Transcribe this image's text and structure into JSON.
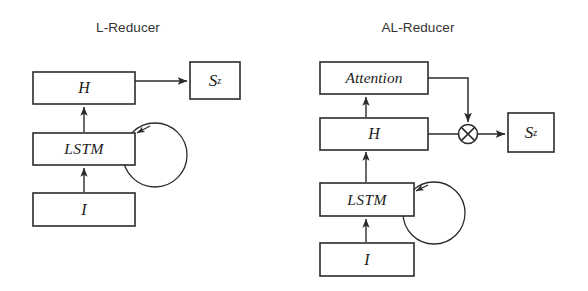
{
  "figure": {
    "background_color": "#ffffff",
    "stroke_color": "#2b2b2b",
    "title_color": "#333333"
  },
  "diagrams": [
    {
      "id": "l-reducer",
      "title": "L-Reducer",
      "nodes": [
        {
          "id": "h",
          "label": "H",
          "shape": "rect"
        },
        {
          "id": "lstm",
          "label": "LSTM",
          "shape": "rect"
        },
        {
          "id": "i",
          "label": "I",
          "shape": "rect"
        },
        {
          "id": "sz",
          "label": "S",
          "superscript": "z",
          "shape": "rect"
        }
      ],
      "edges": [
        {
          "from": "i",
          "to": "lstm",
          "kind": "arrow"
        },
        {
          "from": "lstm",
          "to": "h",
          "kind": "arrow"
        },
        {
          "from": "h",
          "to": "sz",
          "kind": "arrow"
        },
        {
          "from": "lstm",
          "to": "lstm",
          "kind": "self-loop"
        }
      ]
    },
    {
      "id": "al-reducer",
      "title": "AL-Reducer",
      "nodes": [
        {
          "id": "attention",
          "label": "Attention",
          "shape": "rect"
        },
        {
          "id": "h",
          "label": "H",
          "shape": "rect"
        },
        {
          "id": "lstm",
          "label": "LSTM",
          "shape": "rect"
        },
        {
          "id": "i",
          "label": "I",
          "shape": "rect"
        },
        {
          "id": "mul",
          "label": "⊗",
          "shape": "circle-times"
        },
        {
          "id": "sz",
          "label": "S",
          "superscript": "z",
          "shape": "rect"
        }
      ],
      "edges": [
        {
          "from": "i",
          "to": "lstm",
          "kind": "arrow"
        },
        {
          "from": "lstm",
          "to": "h",
          "kind": "arrow"
        },
        {
          "from": "h",
          "to": "attention",
          "kind": "arrow"
        },
        {
          "from": "attention",
          "to": "mul",
          "kind": "elbow-arrow"
        },
        {
          "from": "h",
          "to": "mul",
          "kind": "line"
        },
        {
          "from": "mul",
          "to": "sz",
          "kind": "arrow"
        },
        {
          "from": "lstm",
          "to": "lstm",
          "kind": "self-loop"
        }
      ]
    }
  ]
}
